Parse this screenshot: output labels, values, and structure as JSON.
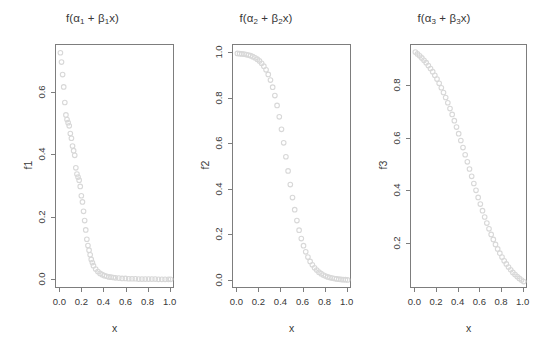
{
  "figure": {
    "background": "#ffffff",
    "marker_color": "#d8d8d8",
    "axis_color": "#7d7d7d",
    "text_color": "#383838",
    "cut_off_header": "."
  },
  "chart_data": [
    {
      "type": "scatter",
      "title": "f(α₁ + β₁x)",
      "title_parts": {
        "fn": "f(",
        "alpha": "α",
        "sub1": "1",
        "plus": "+",
        "beta": "β",
        "sub2": "1",
        "xclose": "x)"
      },
      "xlabel": "x",
      "ylabel": "f1",
      "xlim": [
        -0.04,
        1.04
      ],
      "ylim": [
        -0.03,
        0.755
      ],
      "xticks": [
        0.0,
        0.2,
        0.4,
        0.6,
        0.8,
        1.0
      ],
      "xticklabels": [
        "0.0",
        "0.2",
        "0.4",
        "0.6",
        "0.8",
        "1.0"
      ],
      "yticks": [
        0.0,
        0.2,
        0.4,
        0.6
      ],
      "yticklabels": [
        "0.0",
        "0.2",
        "0.4",
        "0.6"
      ],
      "grid": false,
      "legend": null,
      "marker": "open-circle",
      "x": [
        0.0,
        0.01,
        0.02,
        0.03,
        0.04,
        0.05,
        0.06,
        0.07,
        0.08,
        0.09,
        0.1,
        0.11,
        0.12,
        0.13,
        0.14,
        0.15,
        0.16,
        0.17,
        0.18,
        0.19,
        0.2,
        0.21,
        0.22,
        0.23,
        0.24,
        0.25,
        0.26,
        0.27,
        0.28,
        0.29,
        0.3,
        0.32,
        0.34,
        0.36,
        0.38,
        0.4,
        0.42,
        0.44,
        0.46,
        0.48,
        0.5,
        0.53,
        0.56,
        0.59,
        0.62,
        0.65,
        0.68,
        0.71,
        0.74,
        0.77,
        0.8,
        0.83,
        0.86,
        0.89,
        0.92,
        0.95,
        0.98,
        1.0
      ],
      "y": [
        0.73,
        0.7,
        0.66,
        0.62,
        0.57,
        0.53,
        0.515,
        0.505,
        0.495,
        0.47,
        0.455,
        0.43,
        0.415,
        0.4,
        0.36,
        0.34,
        0.33,
        0.32,
        0.3,
        0.27,
        0.25,
        0.22,
        0.19,
        0.16,
        0.13,
        0.11,
        0.095,
        0.08,
        0.065,
        0.055,
        0.045,
        0.034,
        0.026,
        0.02,
        0.016,
        0.013,
        0.011,
        0.009,
        0.008,
        0.007,
        0.006,
        0.005,
        0.004,
        0.004,
        0.003,
        0.003,
        0.003,
        0.002,
        0.002,
        0.002,
        0.002,
        0.002,
        0.002,
        0.001,
        0.001,
        0.001,
        0.001,
        0.001
      ]
    },
    {
      "type": "scatter",
      "title": "f(α₂ + β₂x)",
      "title_parts": {
        "fn": "f(",
        "alpha": "α",
        "sub1": "2",
        "plus": "+",
        "beta": "β",
        "sub2": "2",
        "xclose": "x)"
      },
      "xlabel": "x",
      "ylabel": "f2",
      "xlim": [
        -0.04,
        1.04
      ],
      "ylim": [
        -0.035,
        1.035
      ],
      "xticks": [
        0.0,
        0.2,
        0.4,
        0.6,
        0.8,
        1.0
      ],
      "xticklabels": [
        "0.0",
        "0.2",
        "0.4",
        "0.6",
        "0.8",
        "1.0"
      ],
      "yticks": [
        0.0,
        0.2,
        0.4,
        0.6,
        0.8,
        1.0
      ],
      "yticklabels": [
        "0.0",
        "0.2",
        "0.4",
        "0.6",
        "0.8",
        "1.0"
      ],
      "grid": false,
      "legend": null,
      "marker": "open-circle",
      "x": [
        0.0,
        0.02,
        0.04,
        0.06,
        0.08,
        0.1,
        0.12,
        0.14,
        0.16,
        0.18,
        0.2,
        0.22,
        0.24,
        0.26,
        0.28,
        0.3,
        0.32,
        0.34,
        0.36,
        0.38,
        0.4,
        0.42,
        0.44,
        0.46,
        0.48,
        0.5,
        0.52,
        0.54,
        0.56,
        0.58,
        0.6,
        0.62,
        0.64,
        0.66,
        0.68,
        0.7,
        0.72,
        0.74,
        0.76,
        0.78,
        0.8,
        0.82,
        0.84,
        0.86,
        0.88,
        0.9,
        0.92,
        0.94,
        0.96,
        0.98,
        1.0
      ],
      "y": [
        0.998,
        0.997,
        0.996,
        0.995,
        0.993,
        0.991,
        0.988,
        0.984,
        0.979,
        0.973,
        0.965,
        0.955,
        0.942,
        0.926,
        0.906,
        0.881,
        0.85,
        0.813,
        0.77,
        0.72,
        0.665,
        0.606,
        0.545,
        0.483,
        0.423,
        0.366,
        0.313,
        0.265,
        0.223,
        0.186,
        0.155,
        0.128,
        0.105,
        0.086,
        0.071,
        0.058,
        0.048,
        0.039,
        0.032,
        0.026,
        0.022,
        0.018,
        0.015,
        0.013,
        0.011,
        0.009,
        0.008,
        0.007,
        0.006,
        0.006,
        0.005
      ]
    },
    {
      "type": "scatter",
      "title": "f(α₃ + β₃x)",
      "title_parts": {
        "fn": "f(",
        "alpha": "α",
        "sub1": "3",
        "plus": "+",
        "beta": "β",
        "sub2": "3",
        "xclose": "x)"
      },
      "xlabel": "x",
      "ylabel": "f3",
      "xlim": [
        -0.04,
        1.04
      ],
      "ylim": [
        0.03,
        0.955
      ],
      "xticks": [
        0.0,
        0.2,
        0.4,
        0.6,
        0.8,
        1.0
      ],
      "xticklabels": [
        "0.0",
        "0.2",
        "0.4",
        "0.6",
        "0.8",
        "1.0"
      ],
      "yticks": [
        0.2,
        0.4,
        0.6,
        0.8
      ],
      "yticklabels": [
        "0.2",
        "0.4",
        "0.6",
        "0.8"
      ],
      "grid": false,
      "legend": null,
      "marker": "open-circle",
      "x": [
        0.0,
        0.02,
        0.04,
        0.06,
        0.08,
        0.1,
        0.12,
        0.14,
        0.16,
        0.18,
        0.2,
        0.22,
        0.24,
        0.26,
        0.28,
        0.3,
        0.32,
        0.34,
        0.36,
        0.38,
        0.4,
        0.42,
        0.44,
        0.46,
        0.48,
        0.5,
        0.52,
        0.54,
        0.56,
        0.58,
        0.6,
        0.62,
        0.64,
        0.66,
        0.68,
        0.7,
        0.72,
        0.74,
        0.76,
        0.78,
        0.8,
        0.82,
        0.84,
        0.86,
        0.88,
        0.9,
        0.92,
        0.94,
        0.96,
        0.98,
        1.0
      ],
      "y": [
        0.928,
        0.921,
        0.914,
        0.906,
        0.897,
        0.888,
        0.877,
        0.866,
        0.854,
        0.84,
        0.826,
        0.81,
        0.793,
        0.775,
        0.756,
        0.736,
        0.714,
        0.692,
        0.668,
        0.644,
        0.619,
        0.593,
        0.566,
        0.539,
        0.512,
        0.485,
        0.457,
        0.43,
        0.404,
        0.377,
        0.352,
        0.327,
        0.303,
        0.28,
        0.258,
        0.237,
        0.218,
        0.199,
        0.182,
        0.166,
        0.151,
        0.137,
        0.125,
        0.113,
        0.103,
        0.093,
        0.085,
        0.077,
        0.07,
        0.064,
        0.058
      ]
    }
  ]
}
